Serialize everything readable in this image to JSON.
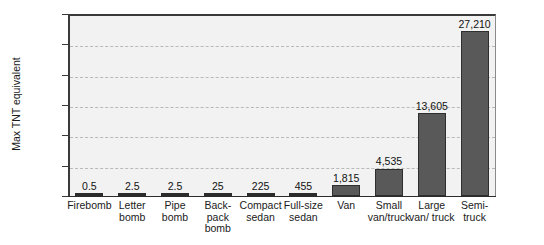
{
  "chart_data": {
    "type": "bar",
    "title": "",
    "xlabel": "",
    "ylabel": "Max TNT equivalent",
    "ylim": [
      0,
      30000
    ],
    "yticks": [
      0,
      5000,
      10000,
      15000,
      20000,
      25000,
      30000
    ],
    "ytick_labels": [
      "0",
      "5,000",
      "10,000",
      "15,000",
      "20,000",
      "25,000",
      "30,000"
    ],
    "grid": true,
    "legend": "none",
    "categories": [
      "Firebomb",
      "Letter bomb",
      "Pipe bomb",
      "Back-pack bomb",
      "Compact sedan",
      "Full-size sedan",
      "Van",
      "Small van/truck",
      "Large van/ truck",
      "Semi-truck"
    ],
    "category_lines": [
      [
        "Firebomb"
      ],
      [
        "Letter",
        "bomb"
      ],
      [
        "Pipe",
        "bomb"
      ],
      [
        "Back-",
        "pack",
        "bomb"
      ],
      [
        "Compact",
        "sedan"
      ],
      [
        "Full-size",
        "sedan"
      ],
      [
        "Van"
      ],
      [
        "Small",
        "van/truck"
      ],
      [
        "Large",
        "van/ truck"
      ],
      [
        "Semi-",
        "truck"
      ]
    ],
    "values": [
      0.5,
      2.5,
      2.5,
      25,
      225,
      455,
      1815,
      4535,
      13605,
      27210
    ],
    "value_labels": [
      "0.5",
      "2.5",
      "2.5",
      "25",
      "225",
      "455",
      "1,815",
      "4,535",
      "13,605",
      "27,210"
    ],
    "colors": {
      "bar_fill": "#595959",
      "bar_edge": "#2e2e2e",
      "plot_background": "#f2f2f2",
      "gridline": "#b9b9b9",
      "axis": "#2b2b2b",
      "text": "#1a1a1a"
    }
  }
}
